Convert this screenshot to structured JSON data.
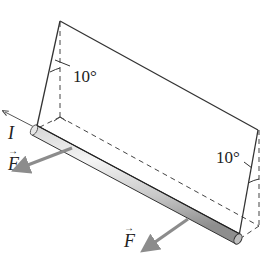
{
  "diagram": {
    "labels": {
      "angle_top": "10°",
      "angle_right": "10°",
      "current": "I",
      "force_left": "F",
      "force_right": "F",
      "vector_arrow": "→"
    },
    "colors": {
      "line": "#333333",
      "force_arrow": "#8c8c8c",
      "rod_light": "#f2f2f2",
      "rod_dark": "#9a9a9a"
    }
  }
}
